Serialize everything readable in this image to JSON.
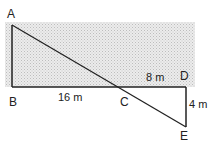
{
  "diagram": {
    "points": {
      "A": {
        "label": "A"
      },
      "B": {
        "label": "B"
      },
      "C": {
        "label": "C"
      },
      "D": {
        "label": "D"
      },
      "E": {
        "label": "E"
      }
    },
    "measurements": {
      "BC": "16 m",
      "CD": "8 m",
      "DE": "4 m"
    },
    "colors": {
      "shade_light": "#e6e6e6",
      "shade_dark": "#c9c9c9",
      "line": "#222222"
    }
  }
}
